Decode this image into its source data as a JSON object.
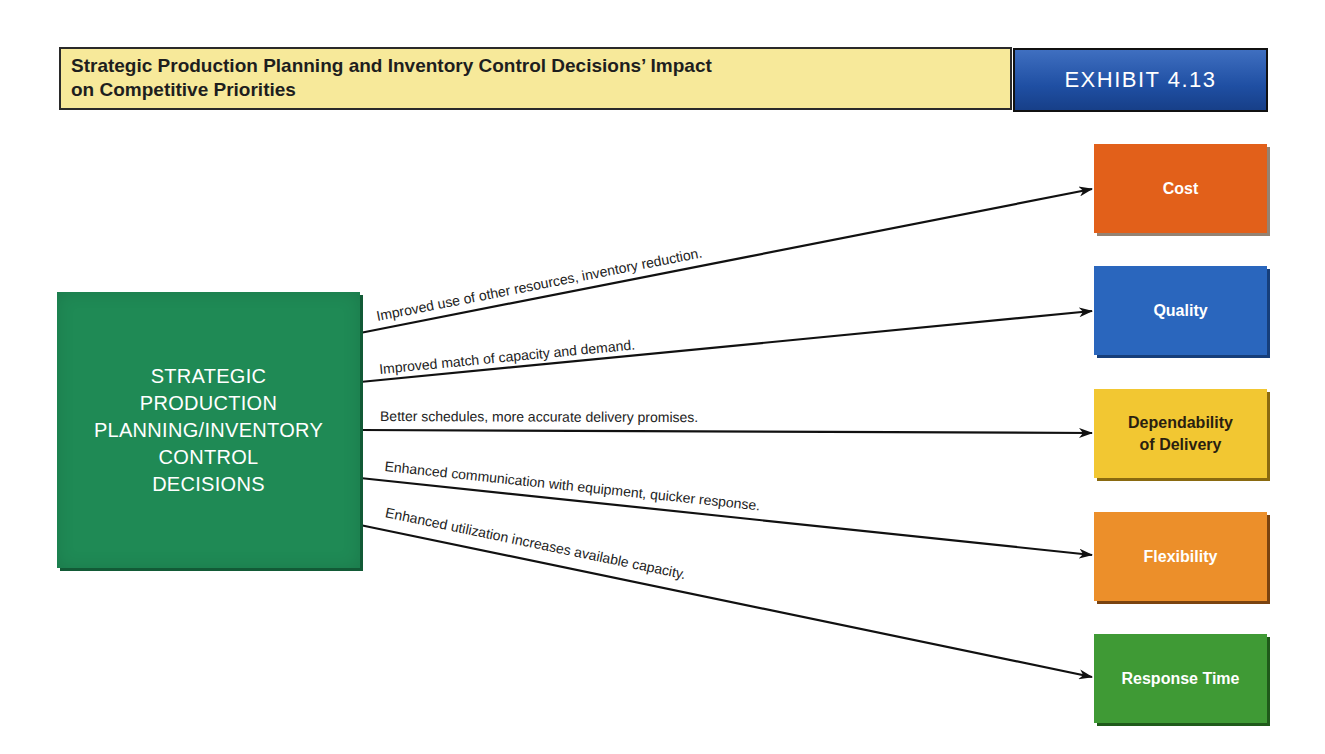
{
  "header": {
    "title_line1": "Strategic Production Planning and Inventory Control Decisions’ Impact",
    "title_line2": "on Competitive Priorities",
    "exhibit_label": "EXHIBIT 4.13",
    "colors": {
      "title_bg": "#f7e99a",
      "exhibit_bg": "#1f4fa3"
    }
  },
  "source": {
    "label": "STRATEGIC\nPRODUCTION\nPLANNING/INVENTORY\nCONTROL\nDECISIONS",
    "color": "#1f8a55"
  },
  "targets": [
    {
      "label": "Cost",
      "color": "#e2601a",
      "text_color": "#ffffff"
    },
    {
      "label": "Quality",
      "color": "#2a66bd",
      "text_color": "#ffffff"
    },
    {
      "label": "Dependability\nof Delivery",
      "color": "#f2c732",
      "text_color": "#2a1f10"
    },
    {
      "label": "Flexibility",
      "color": "#ec8f2a",
      "text_color": "#ffffff"
    },
    {
      "label": "Response Time",
      "color": "#3f9a35",
      "text_color": "#ffffff"
    }
  ],
  "edges": [
    {
      "from": "source",
      "to": "Cost",
      "label": "Improved use of other resources, inventory reduction."
    },
    {
      "from": "source",
      "to": "Quality",
      "label": "Improved match of capacity and demand."
    },
    {
      "from": "source",
      "to": "Dependability of Delivery",
      "label": "Better schedules, more accurate delivery promises."
    },
    {
      "from": "source",
      "to": "Flexibility",
      "label": "Enhanced communication with equipment, quicker response."
    },
    {
      "from": "source",
      "to": "Response Time",
      "label": "Enhanced utilization increases available capacity."
    }
  ]
}
